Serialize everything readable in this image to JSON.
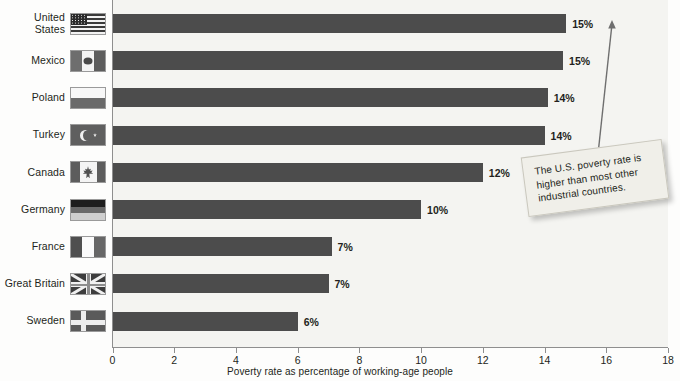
{
  "chart_data": {
    "type": "bar",
    "orientation": "horizontal",
    "title": "",
    "xlabel": "Poverty rate as percentage of working-age people",
    "ylabel": "",
    "xlim": [
      0,
      18
    ],
    "xticks": [
      0,
      2,
      4,
      6,
      8,
      10,
      12,
      14,
      16,
      18
    ],
    "grid": false,
    "legend": null,
    "categories": [
      "United States",
      "Mexico",
      "Poland",
      "Turkey",
      "Canada",
      "Germany",
      "France",
      "Great Britain",
      "Sweden"
    ],
    "values": [
      14.7,
      14.6,
      14.1,
      14.0,
      12.0,
      10.0,
      7.1,
      7.0,
      6.0
    ],
    "data_labels": [
      "15%",
      "15%",
      "14%",
      "14%",
      "12%",
      "10%",
      "7%",
      "7%",
      "6%"
    ],
    "annotations": [
      {
        "text": "The U.S. poverty rate is higher than most other industrial countries.",
        "points_to": "United States"
      }
    ],
    "bar_color": "#4c4c4c",
    "plot_background": "#f4f4f1"
  },
  "axis": {
    "x_title": "Poverty rate as percentage of working-age people",
    "ticks": [
      "0",
      "2",
      "4",
      "6",
      "8",
      "10",
      "12",
      "14",
      "16",
      "18"
    ]
  },
  "rows": [
    {
      "country": "United\nStates",
      "flag": "flag-united-states",
      "flag_class": "fl-us",
      "value": 14.7,
      "label": "15%"
    },
    {
      "country": "Mexico",
      "flag": "flag-mexico",
      "flag_class": "fl-mx",
      "value": 14.6,
      "label": "15%"
    },
    {
      "country": "Poland",
      "flag": "flag-poland",
      "flag_class": "fl-pl",
      "value": 14.1,
      "label": "14%"
    },
    {
      "country": "Turkey",
      "flag": "flag-turkey",
      "flag_class": "fl-tr",
      "value": 14.0,
      "label": "14%"
    },
    {
      "country": "Canada",
      "flag": "flag-canada",
      "flag_class": "fl-ca",
      "value": 12.0,
      "label": "12%"
    },
    {
      "country": "Germany",
      "flag": "flag-germany",
      "flag_class": "fl-de",
      "value": 10.0,
      "label": "10%"
    },
    {
      "country": "France",
      "flag": "flag-france",
      "flag_class": "fl-fr",
      "value": 7.1,
      "label": "7%"
    },
    {
      "country": "Great Britain",
      "flag": "flag-great-britain",
      "flag_class": "fl-gb",
      "value": 7.0,
      "label": "7%"
    },
    {
      "country": "Sweden",
      "flag": "flag-sweden",
      "flag_class": "fl-se",
      "value": 6.0,
      "label": "6%"
    }
  ],
  "callout": {
    "text": "The U.S. poverty rate is higher than most other industrial countries."
  }
}
